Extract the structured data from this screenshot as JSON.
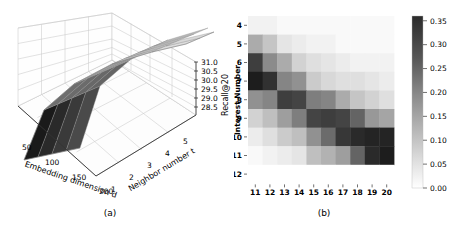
{
  "figure": {
    "panels": [
      {
        "caption": "(a)",
        "type": "surface3d",
        "xlabel": "Embedding dimension d",
        "ylabel": "Neighbor number t",
        "zlabel": "Recall@20",
        "xticks": [
          "50",
          "100",
          "150",
          "200"
        ],
        "yticks": [
          "1",
          "2",
          "3",
          "4",
          "5"
        ],
        "zticks": [
          "28.5",
          "29.0",
          "29.5",
          "30.0",
          "30.5",
          "31.0"
        ]
      },
      {
        "caption": "(b)",
        "type": "heatmap",
        "ylabel": "Interest Number",
        "xticks": [
          "11",
          "12",
          "13",
          "14",
          "15",
          "16",
          "17",
          "18",
          "19",
          "20"
        ],
        "yticks": [
          "4",
          "5",
          "6",
          "7",
          "8",
          "9",
          "10",
          "11",
          "12"
        ],
        "cbar_ticks": [
          "0.00",
          "0.05",
          "0.10",
          "0.15",
          "0.20",
          "0.25",
          "0.30",
          "0.35"
        ]
      }
    ]
  },
  "chart_data": [
    {
      "type": "surface",
      "title": "",
      "panel": "(a)",
      "xlabel": "Embedding dimension d",
      "ylabel": "Neighbor number t",
      "zlabel": "Recall@20",
      "x": [
        50,
        100,
        150,
        200
      ],
      "y": [
        1,
        2,
        3,
        4,
        5
      ],
      "xlim": [
        50,
        200
      ],
      "ylim": [
        1,
        5
      ],
      "zlim": [
        28.5,
        31.0
      ],
      "grid": true,
      "legend": "none",
      "z": [
        [
          28.6,
          30.1,
          30.6,
          30.8
        ],
        [
          28.8,
          30.2,
          30.7,
          30.9
        ],
        [
          29.0,
          30.3,
          30.8,
          31.0
        ],
        [
          29.1,
          30.4,
          30.85,
          31.05
        ],
        [
          29.2,
          30.45,
          30.9,
          31.1
        ]
      ]
    },
    {
      "type": "heatmap",
      "title": "",
      "panel": "(b)",
      "xlabel": "",
      "ylabel": "Interest Number",
      "x": [
        11,
        12,
        13,
        14,
        15,
        16,
        17,
        18,
        19,
        20
      ],
      "y": [
        4,
        5,
        6,
        7,
        8,
        9,
        10,
        11,
        12
      ],
      "vmin": 0.0,
      "vmax": 0.36,
      "colormap": "gray_reversed",
      "cbar_ticks": [
        0.0,
        0.05,
        0.1,
        0.15,
        0.2,
        0.25,
        0.3,
        0.35
      ],
      "cbar_position": "right",
      "grid": false,
      "values": [
        [
          0.02,
          0.02,
          0.01,
          0.01,
          0.01,
          0.01,
          0.01,
          0.01,
          0.01,
          0.01
        ],
        [
          0.13,
          0.09,
          0.04,
          0.03,
          0.02,
          0.02,
          0.01,
          0.01,
          0.01,
          0.01
        ],
        [
          0.3,
          0.18,
          0.13,
          0.07,
          0.05,
          0.04,
          0.03,
          0.02,
          0.02,
          0.02
        ],
        [
          0.35,
          0.32,
          0.19,
          0.17,
          0.08,
          0.06,
          0.05,
          0.05,
          0.04,
          0.03
        ],
        [
          0.17,
          0.19,
          0.3,
          0.29,
          0.2,
          0.19,
          0.13,
          0.09,
          0.07,
          0.05
        ],
        [
          0.07,
          0.1,
          0.15,
          0.2,
          0.29,
          0.3,
          0.29,
          0.24,
          0.16,
          0.14
        ],
        [
          0.03,
          0.05,
          0.08,
          0.1,
          0.17,
          0.23,
          0.31,
          0.33,
          0.34,
          0.34
        ],
        [
          0.01,
          0.02,
          0.03,
          0.04,
          0.1,
          0.12,
          0.15,
          0.24,
          0.33,
          0.35
        ],
        [
          0.0,
          0.0,
          0.0,
          0.0,
          0.0,
          0.0,
          0.0,
          0.0,
          0.0,
          0.0
        ]
      ]
    }
  ]
}
